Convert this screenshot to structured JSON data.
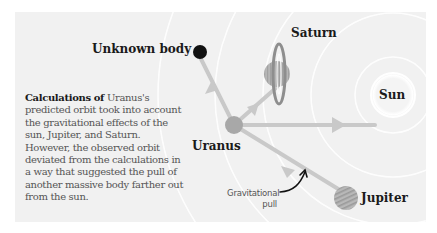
{
  "diagram": {
    "labels": {
      "unknown_body": "Unknown body",
      "saturn": "Saturn",
      "sun": "Sun",
      "uranus": "Uranus",
      "jupiter": "Jupiter",
      "gravitational_pull_line1": "Gravitational",
      "gravitational_pull_line2": "pull"
    },
    "caption": {
      "lead": "Calculations of",
      "body": " Uranus's predicted orbit took into account the gravitational effects of the sun, Jupiter, and Saturn. However, the observed orbit deviated from the calculations in a way that suggested the pull of another massive body farther out from the sun."
    },
    "colors": {
      "panel_bg": "#f1f1f1",
      "arrow": "#c9c9c9",
      "orbit": "#ffffff",
      "uranus": "#a8a8a8",
      "unknown_body": "#111111",
      "saturn_body": "#b3b3b3",
      "saturn_ring": "#8e8e8e",
      "jupiter": "#b0b0b0",
      "sun_glow": "#ffffff",
      "label_text": "#1a1a1a",
      "caption_text": "#555555"
    }
  }
}
